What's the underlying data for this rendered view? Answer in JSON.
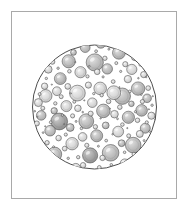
{
  "plate": {
    "title": "Circular microscopic field of view with dispersed spherical particles",
    "caption": "",
    "background_color": "#ffffff",
    "frame": {
      "border_color": "#a9a9a9",
      "border_width": 1,
      "x": 11,
      "y": 11,
      "width": 166,
      "height": 188
    }
  },
  "figure": {
    "type": "scientific-illustration",
    "style": "hand-drawn-engraving",
    "field": {
      "shape": "circle",
      "center_x": 94.5,
      "center_y": 107,
      "radius": 62,
      "outline_color": "#3a3a3a",
      "outline_width": 0.9,
      "fill_color": "#ffffff"
    },
    "particle_style": {
      "outline_color": "#4a4a4a",
      "outline_width": 0.55,
      "fill_light": "#d4d4d4",
      "fill_mid": "#bcbcbc",
      "fill_dark": "#a6a6a6",
      "highlight_color": "#ffffff"
    },
    "particle_count": 168,
    "particles": [
      {
        "x": 94.8,
        "y": 62.4,
        "r": 8.6,
        "tone": "mid"
      },
      {
        "x": 59.2,
        "y": 121.5,
        "r": 8.4,
        "tone": "dark"
      },
      {
        "x": 122.3,
        "y": 96.2,
        "r": 8.2,
        "tone": "mid"
      },
      {
        "x": 110.6,
        "y": 152.8,
        "r": 8.3,
        "tone": "mid"
      },
      {
        "x": 77.4,
        "y": 93.1,
        "r": 7.9,
        "tone": "light"
      },
      {
        "x": 133.2,
        "y": 145.1,
        "r": 7.8,
        "tone": "mid"
      },
      {
        "x": 90.1,
        "y": 155.4,
        "r": 7.6,
        "tone": "dark"
      },
      {
        "x": 86.3,
        "y": 121.2,
        "r": 7.4,
        "tone": "mid"
      },
      {
        "x": 113.8,
        "y": 92.7,
        "r": 6.9,
        "tone": "light"
      },
      {
        "x": 68.7,
        "y": 61.3,
        "r": 6.6,
        "tone": "mid"
      },
      {
        "x": 54.6,
        "y": 154.2,
        "r": 7.1,
        "tone": "mid"
      },
      {
        "x": 138.1,
        "y": 88.6,
        "r": 6.7,
        "tone": "mid"
      },
      {
        "x": 103.4,
        "y": 110.9,
        "r": 6.8,
        "tone": "mid"
      },
      {
        "x": 118.9,
        "y": 52.8,
        "r": 6.4,
        "tone": "mid"
      },
      {
        "x": 45.7,
        "y": 95.9,
        "r": 6.3,
        "tone": "light"
      },
      {
        "x": 72.1,
        "y": 143.7,
        "r": 6.2,
        "tone": "light"
      },
      {
        "x": 128.4,
        "y": 117.3,
        "r": 6.1,
        "tone": "mid"
      },
      {
        "x": 100.2,
        "y": 88.4,
        "r": 6.3,
        "tone": "light"
      },
      {
        "x": 60.3,
        "y": 78.6,
        "r": 5.9,
        "tone": "mid"
      },
      {
        "x": 141.6,
        "y": 110.4,
        "r": 5.8,
        "tone": "mid"
      },
      {
        "x": 80.5,
        "y": 72.2,
        "r": 5.6,
        "tone": "light"
      },
      {
        "x": 96.7,
        "y": 135.8,
        "r": 6.0,
        "tone": "mid"
      },
      {
        "x": 118.2,
        "y": 131.6,
        "r": 5.4,
        "tone": "light"
      },
      {
        "x": 66.4,
        "y": 106.1,
        "r": 5.5,
        "tone": "light"
      },
      {
        "x": 107.3,
        "y": 68.9,
        "r": 5.2,
        "tone": "mid"
      },
      {
        "x": 50.1,
        "y": 130.7,
        "r": 5.3,
        "tone": "mid"
      },
      {
        "x": 131.8,
        "y": 69.4,
        "r": 5.1,
        "tone": "light"
      },
      {
        "x": 85.2,
        "y": 47.6,
        "r": 4.9,
        "tone": "mid"
      },
      {
        "x": 145.3,
        "y": 128.2,
        "r": 5.0,
        "tone": "mid"
      },
      {
        "x": 41.2,
        "y": 115.4,
        "r": 4.8,
        "tone": "mid"
      },
      {
        "x": 75.8,
        "y": 168.1,
        "r": 4.7,
        "tone": "light"
      },
      {
        "x": 109.4,
        "y": 173.2,
        "r": 4.6,
        "tone": "mid"
      },
      {
        "x": 92.3,
        "y": 102.7,
        "r": 4.8,
        "tone": "light"
      },
      {
        "x": 124.7,
        "y": 163.4,
        "r": 4.5,
        "tone": "light"
      },
      {
        "x": 56.9,
        "y": 91.2,
        "r": 4.4,
        "tone": "light"
      },
      {
        "x": 147.1,
        "y": 98.3,
        "r": 4.3,
        "tone": "mid"
      },
      {
        "x": 63.5,
        "y": 48.7,
        "r": 4.2,
        "tone": "light"
      },
      {
        "x": 100.8,
        "y": 44.1,
        "r": 4.1,
        "tone": "mid"
      },
      {
        "x": 38.4,
        "y": 102.6,
        "r": 4.0,
        "tone": "light"
      },
      {
        "x": 82.6,
        "y": 136.9,
        "r": 4.3,
        "tone": "light"
      },
      {
        "x": 135.2,
        "y": 56.8,
        "r": 3.9,
        "tone": "mid"
      },
      {
        "x": 114.5,
        "y": 114.2,
        "r": 3.8,
        "tone": "light"
      },
      {
        "x": 70.2,
        "y": 127.5,
        "r": 3.9,
        "tone": "mid"
      },
      {
        "x": 48.3,
        "y": 69.4,
        "r": 3.8,
        "tone": "light"
      },
      {
        "x": 127.9,
        "y": 79.1,
        "r": 3.7,
        "tone": "light"
      },
      {
        "x": 92.9,
        "y": 176.3,
        "r": 3.6,
        "tone": "mid"
      },
      {
        "x": 63.1,
        "y": 166.8,
        "r": 3.5,
        "tone": "light"
      },
      {
        "x": 151.4,
        "y": 115.7,
        "r": 3.6,
        "tone": "light"
      },
      {
        "x": 105.7,
        "y": 125.4,
        "r": 3.4,
        "tone": "mid"
      },
      {
        "x": 77.9,
        "y": 108.3,
        "r": 3.3,
        "tone": "light"
      },
      {
        "x": 139.8,
        "y": 133.9,
        "r": 3.5,
        "tone": "light"
      },
      {
        "x": 54.2,
        "y": 110.8,
        "r": 3.2,
        "tone": "mid"
      },
      {
        "x": 121.6,
        "y": 143.2,
        "r": 3.4,
        "tone": "mid"
      },
      {
        "x": 88.4,
        "y": 85.1,
        "r": 3.1,
        "tone": "light"
      },
      {
        "x": 44.6,
        "y": 86.2,
        "r": 3.2,
        "tone": "light"
      },
      {
        "x": 110.1,
        "y": 41.3,
        "r": 3.0,
        "tone": "light"
      },
      {
        "x": 73.5,
        "y": 52.4,
        "r": 2.9,
        "tone": "mid"
      },
      {
        "x": 143.7,
        "y": 74.6,
        "r": 3.1,
        "tone": "light"
      },
      {
        "x": 97.2,
        "y": 71.8,
        "r": 2.8,
        "tone": "light"
      },
      {
        "x": 67.8,
        "y": 86.4,
        "r": 2.9,
        "tone": "light"
      },
      {
        "x": 131.4,
        "y": 103.8,
        "r": 2.8,
        "tone": "mid"
      },
      {
        "x": 83.1,
        "y": 165.2,
        "r": 2.7,
        "tone": "light"
      },
      {
        "x": 58.6,
        "y": 138.1,
        "r": 2.8,
        "tone": "light"
      },
      {
        "x": 116.8,
        "y": 176.4,
        "r": 2.6,
        "tone": "light"
      },
      {
        "x": 102.5,
        "y": 157.9,
        "r": 2.7,
        "tone": "light"
      },
      {
        "x": 36.9,
        "y": 123.4,
        "r": 2.5,
        "tone": "light"
      },
      {
        "x": 125.3,
        "y": 64.2,
        "r": 2.6,
        "tone": "light"
      },
      {
        "x": 90.7,
        "y": 113.6,
        "r": 2.5,
        "tone": "light"
      },
      {
        "x": 148.2,
        "y": 88.1,
        "r": 2.4,
        "tone": "light"
      },
      {
        "x": 52.4,
        "y": 61.8,
        "r": 2.5,
        "tone": "light"
      },
      {
        "x": 79.3,
        "y": 38.2,
        "r": 2.4,
        "tone": "light"
      },
      {
        "x": 108.6,
        "y": 101.4,
        "r": 2.3,
        "tone": "light"
      },
      {
        "x": 64.7,
        "y": 148.6,
        "r": 2.4,
        "tone": "light"
      },
      {
        "x": 137.5,
        "y": 120.3,
        "r": 2.3,
        "tone": "light"
      },
      {
        "x": 95.4,
        "y": 126.8,
        "r": 2.2,
        "tone": "light"
      },
      {
        "x": 119.8,
        "y": 107.2,
        "r": 2.3,
        "tone": "light"
      },
      {
        "x": 47.1,
        "y": 142.7,
        "r": 2.2,
        "tone": "light"
      },
      {
        "x": 72.6,
        "y": 115.9,
        "r": 2.1,
        "tone": "light"
      },
      {
        "x": 104.9,
        "y": 58.3,
        "r": 2.2,
        "tone": "light"
      },
      {
        "x": 142.4,
        "y": 101.6,
        "r": 2.1,
        "tone": "light"
      },
      {
        "x": 61.2,
        "y": 96.7,
        "r": 2.0,
        "tone": "light"
      },
      {
        "x": 86.8,
        "y": 145.3,
        "r": 2.1,
        "tone": "light"
      },
      {
        "x": 128.7,
        "y": 135.8,
        "r": 2.0,
        "tone": "light"
      },
      {
        "x": 99.3,
        "y": 167.4,
        "r": 1.9,
        "tone": "light"
      },
      {
        "x": 42.8,
        "y": 108.2,
        "r": 2.0,
        "tone": "light"
      },
      {
        "x": 113.2,
        "y": 81.6,
        "r": 1.9,
        "tone": "light"
      },
      {
        "x": 69.4,
        "y": 71.3,
        "r": 1.8,
        "tone": "light"
      },
      {
        "x": 133.9,
        "y": 154.1,
        "r": 1.9,
        "tone": "light"
      },
      {
        "x": 91.6,
        "y": 36.8,
        "r": 1.8,
        "tone": "light"
      },
      {
        "x": 55.3,
        "y": 103.4,
        "r": 1.7,
        "tone": "light"
      },
      {
        "x": 122.4,
        "y": 124.6,
        "r": 1.8,
        "tone": "light"
      },
      {
        "x": 78.2,
        "y": 157.2,
        "r": 1.7,
        "tone": "light"
      },
      {
        "x": 146.8,
        "y": 122.4,
        "r": 1.6,
        "tone": "light"
      },
      {
        "x": 101.7,
        "y": 95.2,
        "r": 1.7,
        "tone": "light"
      },
      {
        "x": 65.8,
        "y": 134.6,
        "r": 1.6,
        "tone": "light"
      },
      {
        "x": 116.3,
        "y": 63.1,
        "r": 1.5,
        "tone": "light"
      },
      {
        "x": 87.5,
        "y": 76.4,
        "r": 1.6,
        "tone": "light"
      },
      {
        "x": 39.6,
        "y": 94.1,
        "r": 1.5,
        "tone": "light"
      },
      {
        "x": 129.8,
        "y": 91.4,
        "r": 1.4,
        "tone": "light"
      },
      {
        "x": 74.3,
        "y": 101.8,
        "r": 1.5,
        "tone": "light"
      },
      {
        "x": 106.2,
        "y": 140.6,
        "r": 1.4,
        "tone": "light"
      },
      {
        "x": 50.7,
        "y": 122.3,
        "r": 1.4,
        "tone": "light"
      },
      {
        "x": 140.2,
        "y": 64.8,
        "r": 1.3,
        "tone": "light"
      },
      {
        "x": 96.1,
        "y": 51.2,
        "r": 1.4,
        "tone": "light"
      },
      {
        "x": 81.4,
        "y": 128.4,
        "r": 1.3,
        "tone": "light"
      },
      {
        "x": 124.6,
        "y": 152.3,
        "r": 1.3,
        "tone": "light"
      },
      {
        "x": 58.1,
        "y": 68.2,
        "r": 1.2,
        "tone": "light"
      },
      {
        "x": 111.3,
        "y": 164.8,
        "r": 1.3,
        "tone": "light"
      },
      {
        "x": 152.1,
        "y": 105.2,
        "r": 1.2,
        "tone": "light"
      },
      {
        "x": 68.2,
        "y": 158.3,
        "r": 1.2,
        "tone": "light"
      },
      {
        "x": 93.8,
        "y": 93.6,
        "r": 1.2,
        "tone": "light"
      },
      {
        "x": 135.4,
        "y": 111.7,
        "r": 1.1,
        "tone": "light"
      },
      {
        "x": 46.3,
        "y": 78.4,
        "r": 1.2,
        "tone": "light"
      },
      {
        "x": 103.1,
        "y": 76.9,
        "r": 1.1,
        "tone": "light"
      },
      {
        "x": 120.7,
        "y": 71.4,
        "r": 1.1,
        "tone": "light"
      },
      {
        "x": 62.4,
        "y": 115.2,
        "r": 1.1,
        "tone": "light"
      },
      {
        "x": 85.9,
        "y": 182.1,
        "r": 1.1,
        "tone": "light"
      },
      {
        "x": 144.1,
        "y": 140.6,
        "r": 1.0,
        "tone": "light"
      },
      {
        "x": 76.1,
        "y": 121.4,
        "r": 1.0,
        "tone": "light"
      },
      {
        "x": 108.9,
        "y": 49.2,
        "r": 1.0,
        "tone": "light"
      },
      {
        "x": 53.6,
        "y": 146.8,
        "r": 1.0,
        "tone": "light"
      },
      {
        "x": 131.2,
        "y": 46.3,
        "r": 1.0,
        "tone": "light"
      },
      {
        "x": 98.4,
        "y": 146.2,
        "r": 1.0,
        "tone": "light"
      },
      {
        "x": 71.3,
        "y": 38.9,
        "r": 0.9,
        "tone": "light"
      },
      {
        "x": 149.6,
        "y": 131.4,
        "r": 0.9,
        "tone": "light"
      },
      {
        "x": 43.1,
        "y": 132.6,
        "r": 0.9,
        "tone": "light"
      },
      {
        "x": 117.5,
        "y": 118.8,
        "r": 0.9,
        "tone": "light"
      },
      {
        "x": 89.2,
        "y": 66.3,
        "r": 0.9,
        "tone": "light"
      },
      {
        "x": 126.8,
        "y": 172.1,
        "r": 0.9,
        "tone": "light"
      },
      {
        "x": 60.8,
        "y": 172.3,
        "r": 0.9,
        "tone": "light"
      },
      {
        "x": 138.4,
        "y": 78.2,
        "r": 0.8,
        "tone": "light"
      },
      {
        "x": 82.7,
        "y": 112.1,
        "r": 0.8,
        "tone": "light"
      },
      {
        "x": 105.3,
        "y": 34.8,
        "r": 0.8,
        "tone": "light"
      },
      {
        "x": 48.9,
        "y": 154.2,
        "r": 0.8,
        "tone": "light"
      },
      {
        "x": 112.6,
        "y": 134.2,
        "r": 0.8,
        "tone": "light"
      },
      {
        "x": 66.9,
        "y": 178.4,
        "r": 0.8,
        "tone": "light"
      },
      {
        "x": 141.3,
        "y": 94.6,
        "r": 0.8,
        "tone": "light"
      },
      {
        "x": 34.8,
        "y": 111.2,
        "r": 0.8,
        "tone": "light"
      },
      {
        "x": 94.1,
        "y": 186.2,
        "r": 0.8,
        "tone": "light"
      },
      {
        "x": 122.9,
        "y": 36.4,
        "r": 0.7,
        "tone": "light"
      },
      {
        "x": 57.2,
        "y": 56.1,
        "r": 0.7,
        "tone": "light"
      },
      {
        "x": 100.6,
        "y": 118.4,
        "r": 0.7,
        "tone": "light"
      },
      {
        "x": 146.2,
        "y": 77.1,
        "r": 0.7,
        "tone": "light"
      },
      {
        "x": 79.6,
        "y": 174.6,
        "r": 0.7,
        "tone": "light"
      },
      {
        "x": 134.8,
        "y": 163.2,
        "r": 0.7,
        "tone": "light"
      },
      {
        "x": 70.8,
        "y": 93.4,
        "r": 0.7,
        "tone": "light"
      },
      {
        "x": 115.1,
        "y": 27.3,
        "r": 0.7,
        "tone": "light"
      },
      {
        "x": 40.2,
        "y": 140.1,
        "r": 0.7,
        "tone": "light"
      },
      {
        "x": 87.1,
        "y": 29.4,
        "r": 0.7,
        "tone": "light"
      },
      {
        "x": 152.8,
        "y": 96.2,
        "r": 0.6,
        "tone": "light"
      },
      {
        "x": 104.2,
        "y": 181.3,
        "r": 0.6,
        "tone": "light"
      },
      {
        "x": 51.8,
        "y": 84.6,
        "r": 0.6,
        "tone": "light"
      },
      {
        "x": 127.3,
        "y": 128.1,
        "r": 0.6,
        "tone": "light"
      },
      {
        "x": 75.4,
        "y": 62.1,
        "r": 0.6,
        "tone": "light"
      },
      {
        "x": 148.9,
        "y": 109.3,
        "r": 0.6,
        "tone": "light"
      },
      {
        "x": 93.4,
        "y": 42.1,
        "r": 0.6,
        "tone": "light"
      },
      {
        "x": 119.4,
        "y": 87.2,
        "r": 0.6,
        "tone": "light"
      },
      {
        "x": 37.4,
        "y": 116.8,
        "r": 0.6,
        "tone": "light"
      },
      {
        "x": 64.1,
        "y": 124.1,
        "r": 0.6,
        "tone": "light"
      },
      {
        "x": 109.8,
        "y": 108.6,
        "r": 0.6,
        "tone": "light"
      },
      {
        "x": 142.7,
        "y": 148.2,
        "r": 0.6,
        "tone": "light"
      },
      {
        "x": 84.3,
        "y": 100.4,
        "r": 0.6,
        "tone": "light"
      },
      {
        "x": 98.9,
        "y": 29.2,
        "r": 0.6,
        "tone": "light"
      },
      {
        "x": 45.2,
        "y": 126.3,
        "r": 0.6,
        "tone": "light"
      },
      {
        "x": 130.6,
        "y": 183.1,
        "r": 0.5,
        "tone": "light"
      },
      {
        "x": 73.1,
        "y": 186.4,
        "r": 0.5,
        "tone": "light"
      },
      {
        "x": 155.1,
        "y": 119.6,
        "r": 0.5,
        "tone": "light"
      }
    ]
  }
}
